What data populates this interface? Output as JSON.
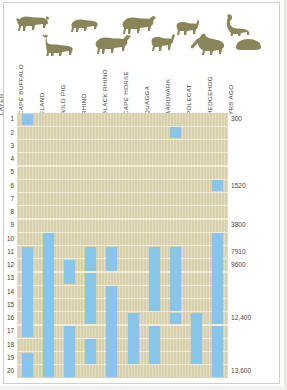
{
  "figure": {
    "background_color": "#ffffff",
    "plot_background_color": "#d8cfab",
    "bar_color": "#87c5eb",
    "gridline_color": "#f2ecda",
    "silhouette_color": "#8a8459"
  },
  "axis": {
    "layer_axis_title": "LAYER",
    "years_axis_title": "YRS AGO"
  },
  "chart_data": {
    "type": "bar",
    "title": "",
    "subtitle": "",
    "xlabel": "",
    "ylabel": "LAYER",
    "orientation": "vertical-range-columns",
    "grid": true,
    "legend_position": "none",
    "categories": [
      "CAPE BUFFALO",
      "ELAND",
      "WILD PIG",
      "RHINO",
      "BLACK RHINO",
      "CAPE HORSE",
      "QUAGGA",
      "AARDVARK",
      "POLECAT",
      "HEDGEHOG"
    ],
    "layers": [
      1,
      2,
      3,
      4,
      5,
      6,
      7,
      8,
      9,
      10,
      11,
      12,
      13,
      14,
      15,
      16,
      17,
      18,
      19,
      20
    ],
    "ylim": [
      1,
      20
    ],
    "year_ticks": [
      {
        "layer": 1,
        "label": "300"
      },
      {
        "layer": 6,
        "label": "1520"
      },
      {
        "layer": 9,
        "label": "3800"
      },
      {
        "layer": 11,
        "label": "7910"
      },
      {
        "layer": 12,
        "label": "9600"
      },
      {
        "layer": 16,
        "label": "12,400"
      },
      {
        "layer": 20,
        "label": "13,600"
      }
    ],
    "series": [
      {
        "name": "CAPE BUFFALO",
        "column": 0,
        "ranges": [
          {
            "from_layer": 1,
            "to_layer": 1
          },
          {
            "from_layer": 11,
            "to_layer": 17
          },
          {
            "from_layer": 19,
            "to_layer": 20
          }
        ]
      },
      {
        "name": "ELAND",
        "column": 1,
        "ranges": [
          {
            "from_layer": 10,
            "to_layer": 20
          }
        ]
      },
      {
        "name": "WILD PIG",
        "column": 2,
        "ranges": [
          {
            "from_layer": 12,
            "to_layer": 13
          },
          {
            "from_layer": 17,
            "to_layer": 20
          }
        ]
      },
      {
        "name": "RHINO",
        "column": 3,
        "ranges": [
          {
            "from_layer": 11,
            "to_layer": 12
          },
          {
            "from_layer": 13,
            "to_layer": 16
          },
          {
            "from_layer": 18,
            "to_layer": 19
          }
        ]
      },
      {
        "name": "BLACK RHINO",
        "column": 4,
        "ranges": [
          {
            "from_layer": 11,
            "to_layer": 12
          },
          {
            "from_layer": 14,
            "to_layer": 20
          }
        ]
      },
      {
        "name": "CAPE HORSE",
        "column": 5,
        "ranges": [
          {
            "from_layer": 16,
            "to_layer": 19
          }
        ]
      },
      {
        "name": "QUAGGA",
        "column": 6,
        "ranges": [
          {
            "from_layer": 11,
            "to_layer": 15
          },
          {
            "from_layer": 17,
            "to_layer": 19
          }
        ]
      },
      {
        "name": "AARDVARK",
        "column": 7,
        "ranges": [
          {
            "from_layer": 2,
            "to_layer": 2
          },
          {
            "from_layer": 11,
            "to_layer": 15
          },
          {
            "from_layer": 16,
            "to_layer": 16
          }
        ]
      },
      {
        "name": "POLECAT",
        "column": 8,
        "ranges": [
          {
            "from_layer": 16,
            "to_layer": 19
          }
        ]
      },
      {
        "name": "HEDGEHOG",
        "column": 9,
        "ranges": [
          {
            "from_layer": 6,
            "to_layer": 6
          },
          {
            "from_layer": 10,
            "to_layer": 16
          },
          {
            "from_layer": 17,
            "to_layer": 20
          }
        ]
      }
    ]
  },
  "silhouettes": [
    {
      "name": "cape-buffalo-silhouette",
      "row": 0,
      "col": 0
    },
    {
      "name": "wild-pig-silhouette",
      "row": 0,
      "col": 1
    },
    {
      "name": "rhino-silhouette",
      "row": 0,
      "col": 2
    },
    {
      "name": "cape-horse-silhouette",
      "row": 0,
      "col": 3
    },
    {
      "name": "polecat-silhouette",
      "row": 0,
      "col": 4
    },
    {
      "name": "eland-silhouette",
      "row": 1,
      "col": 0
    },
    {
      "name": "black-rhino-silhouette",
      "row": 1,
      "col": 1
    },
    {
      "name": "quagga-silhouette",
      "row": 1,
      "col": 2
    },
    {
      "name": "aardvark-silhouette",
      "row": 1,
      "col": 3
    },
    {
      "name": "hedgehog-silhouette",
      "row": 1,
      "col": 4
    }
  ]
}
